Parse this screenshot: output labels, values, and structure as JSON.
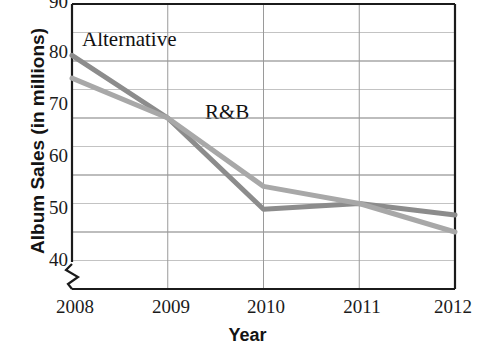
{
  "chart_data": {
    "type": "line",
    "title": "",
    "xlabel": "Year",
    "ylabel": "Album Sales (in millions)",
    "categories": [
      "2008",
      "2009",
      "2010",
      "2011",
      "2012"
    ],
    "x": [
      2008,
      2009,
      2010,
      2011,
      2012
    ],
    "xlim": [
      2008,
      2012
    ],
    "ylim": [
      40,
      90
    ],
    "y_axis_break": true,
    "y_axis_break_note": "axis broken below 40",
    "yticks": [
      40,
      50,
      60,
      70,
      80,
      90
    ],
    "ytick_labels": [
      "40",
      "50",
      "60",
      "70",
      "80",
      "90"
    ],
    "y_minor_gridlines": [
      45,
      55,
      65,
      75,
      85
    ],
    "grid": true,
    "legend": "inline-labels",
    "series": [
      {
        "name": "Alternative",
        "color": "#8c8c8c",
        "values": [
          81,
          70,
          54,
          55,
          53
        ],
        "label_text": "Alternative"
      },
      {
        "name": "R&B",
        "color": "#a8a8a8",
        "values": [
          77,
          70,
          58,
          55,
          50
        ],
        "label_text": "R&B"
      }
    ],
    "annotations": [
      {
        "text": "Alternative",
        "x": 2008.2,
        "y": 84
      },
      {
        "text": "R&B",
        "x": 2009.5,
        "y": 66
      }
    ]
  },
  "axis": {
    "y_title": "Album Sales (in millions)",
    "x_title": "Year",
    "y_labels": [
      "90",
      "80",
      "70",
      "60",
      "50",
      "40"
    ],
    "x_labels": [
      "2008",
      "2009",
      "2010",
      "2011",
      "2012"
    ]
  },
  "colors": {
    "axis": "#1b1b1b",
    "gridline": "#8f8f8f",
    "series_alternative": "#8c8c8c",
    "series_rb": "#a8a8a8",
    "background": "#ffffff",
    "text": "#141414"
  }
}
